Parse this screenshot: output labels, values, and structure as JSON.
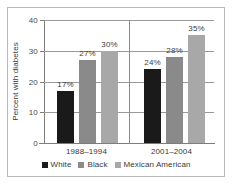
{
  "chart_data": {
    "type": "bar",
    "title": "",
    "xlabel": "",
    "ylabel": "Percent with diabetes",
    "categories": [
      "1988–1994",
      "2001–2004"
    ],
    "ylim": [
      0,
      40
    ],
    "yticks": [
      0,
      10,
      20,
      30,
      40
    ],
    "ytick_labels": [
      "0",
      "10",
      "20",
      "30",
      "40"
    ],
    "grid": true,
    "legend_position": "bottom-center",
    "series": [
      {
        "name": "White",
        "color": "#1a1a1a",
        "values": [
          17,
          24
        ],
        "labels": [
          "17%",
          "24%"
        ]
      },
      {
        "name": "Black",
        "color": "#8a8a8a",
        "values": [
          27,
          28
        ],
        "labels": [
          "27%",
          "28%"
        ]
      },
      {
        "name": "Mexican American",
        "color": "#a8a8a8",
        "values": [
          30,
          35
        ],
        "labels": [
          "30%",
          "35%"
        ]
      }
    ]
  }
}
